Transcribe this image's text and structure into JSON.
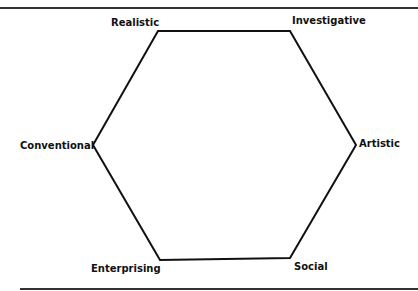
{
  "diagram": {
    "type": "hexagon",
    "labels": {
      "realistic": "Realistic",
      "investigative": "Investigative",
      "artistic": "Artistic",
      "social": "Social",
      "enterprising": "Enterprising",
      "conventional": "Conventional"
    },
    "order": [
      "Realistic",
      "Investigative",
      "Artistic",
      "Social",
      "Enterprising",
      "Conventional"
    ],
    "line_color": "#111111"
  }
}
